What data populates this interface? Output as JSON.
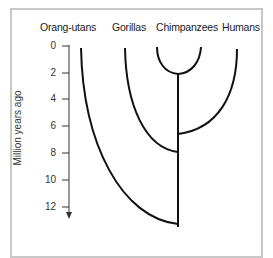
{
  "diagram": {
    "type": "phylogenetic-tree",
    "species_labels": [
      "Orang-utans",
      "Gorillas",
      "Chimpanzees",
      "Humans"
    ],
    "y_axis": {
      "label": "Million years ago",
      "ticks": [
        "0",
        "2",
        "4",
        "6",
        "8",
        "10",
        "12"
      ]
    },
    "divergences": [
      {
        "between": "Chimpanzees",
        "and": "Chimpanzees (two lineages)",
        "million_years_ago": 2
      },
      {
        "between": "Humans",
        "and": "Chimpanzees",
        "million_years_ago": 6.5
      },
      {
        "between": "Gorillas",
        "and": "Chimpanzees/Humans",
        "million_years_ago": 8
      },
      {
        "between": "Orang-utans",
        "and": "African apes",
        "million_years_ago": 13
      }
    ],
    "colors": {
      "line": "#111111",
      "frame": "#c8c8c8",
      "text": "#222222"
    }
  }
}
